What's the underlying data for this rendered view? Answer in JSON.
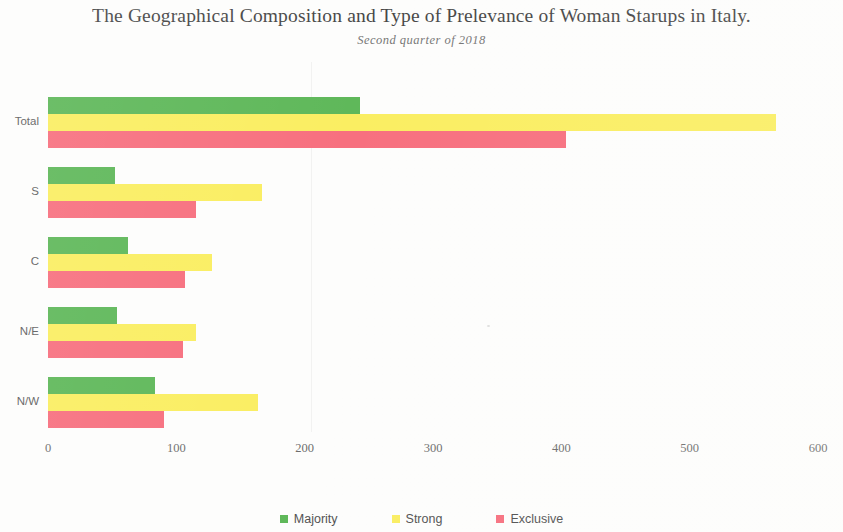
{
  "title": "The Geographical Composition and Type of Prelevance of Woman Starups in Italy.",
  "subtitle": "Second quarter of 2018",
  "legend": {
    "items": [
      {
        "label": "Majority",
        "color": "#5FB85A",
        "key": "majority"
      },
      {
        "label": "Strong",
        "color": "#FAEE62",
        "key": "strong"
      },
      {
        "label": "Exclusive",
        "color": "#F7707F",
        "key": "exclusive"
      }
    ]
  },
  "axis": {
    "x_ticks": [
      "0",
      "100",
      "200",
      "300",
      "400",
      "500",
      "600"
    ],
    "y_labels": [
      "Total",
      "S",
      "C",
      "N/E",
      "N/W"
    ]
  },
  "chart_data": {
    "type": "bar",
    "orientation": "horizontal",
    "title": "The Geographical Composition and Type of Prelevance of Woman Starups in Italy.",
    "subtitle": "Second quarter of 2018",
    "xlabel": "",
    "ylabel": "",
    "xlim": [
      0,
      600
    ],
    "xticks": [
      0,
      100,
      200,
      300,
      400,
      500,
      600
    ],
    "grid": false,
    "legend_position": "bottom",
    "categories": [
      "Total",
      "S",
      "C",
      "N/E",
      "N/W"
    ],
    "series": [
      {
        "name": "Majority",
        "color": "#5FB85A",
        "values": [
          243,
          52,
          62,
          54,
          83
        ]
      },
      {
        "name": "Strong",
        "color": "#FAEE62",
        "values": [
          567,
          167,
          128,
          115,
          164
        ]
      },
      {
        "name": "Exclusive",
        "color": "#F7707F",
        "values": [
          404,
          115,
          107,
          105,
          90
        ]
      }
    ]
  }
}
